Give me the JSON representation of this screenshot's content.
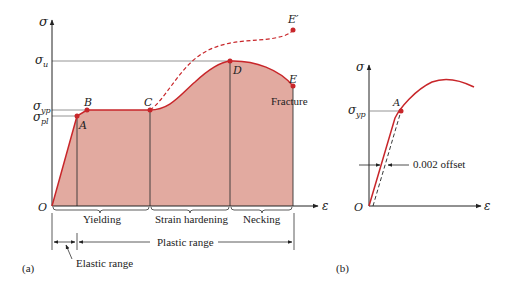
{
  "panel_a": {
    "panel_label": "(a)",
    "axis_y_label": "σ",
    "axis_x_label": "ε",
    "origin_label": "O",
    "stress_levels": {
      "sigma_u": {
        "symbol": "σ",
        "subscript": "u"
      },
      "sigma_yp": {
        "symbol": "σ",
        "subscript": "yp"
      },
      "sigma_pl": {
        "symbol": "σ",
        "subscript": "pl"
      }
    },
    "points": {
      "A": "A",
      "B": "B",
      "C": "C",
      "D": "D",
      "E": "E",
      "E_prime": "E′"
    },
    "fracture_label": "Fracture",
    "regions": {
      "yielding": "Yielding",
      "strain_hardening": "Strain hardening",
      "necking": "Necking"
    },
    "ranges": {
      "plastic": "Plastic range",
      "elastic": "Elastic range"
    }
  },
  "panel_b": {
    "panel_label": "(b)",
    "axis_y_label": "σ",
    "axis_x_label": "ε",
    "origin_label": "O",
    "stress_level": {
      "symbol": "σ",
      "subscript": "yp"
    },
    "point_A": "A",
    "offset_label": "0.002 offset"
  },
  "colors": {
    "curve": "#c8262a",
    "fill": "#e2aaa0",
    "axis": "#222222",
    "guide": "#888888"
  }
}
